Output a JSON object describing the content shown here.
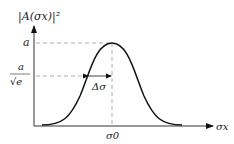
{
  "diagram": {
    "type": "gaussian-envelope",
    "y_axis_label": "|A(σx)|²",
    "x_axis_label": "σx",
    "peak_label": "a",
    "half_level_numerator": "a",
    "half_level_denominator": "√e",
    "width_label": "Δσ",
    "center_label": "σ0",
    "colors": {
      "curve": "#111111",
      "axis": "#333333",
      "dashed": "#999999"
    }
  }
}
